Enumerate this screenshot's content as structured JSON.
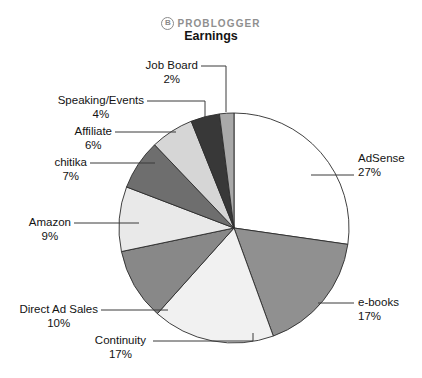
{
  "brand": {
    "mark": "B",
    "name": "PROBLOGGER"
  },
  "chart_data": {
    "type": "pie",
    "title": "Earnings",
    "xlabel": "",
    "ylabel": "",
    "legend_position": "callout-labels",
    "grid": false,
    "start_angle_deg": 0,
    "direction": "clockwise",
    "categories": [
      "AdSense",
      "e-books",
      "Continuity",
      "Direct Ad Sales",
      "Amazon",
      "chitika",
      "Affiliate",
      "Speaking/Events",
      "Job Board"
    ],
    "values": [
      27,
      17,
      17,
      10,
      9,
      7,
      6,
      4,
      2
    ],
    "value_unit": "%",
    "slices": [
      {
        "label": "AdSense",
        "value": 27,
        "pct_text": "27%",
        "color": "#ffffff"
      },
      {
        "label": "e-books",
        "value": 17,
        "pct_text": "17%",
        "color": "#909090"
      },
      {
        "label": "Continuity",
        "value": 17,
        "pct_text": "17%",
        "color": "#f1f1f1"
      },
      {
        "label": "Direct Ad Sales",
        "value": 10,
        "pct_text": "10%",
        "color": "#888888"
      },
      {
        "label": "Amazon",
        "value": 9,
        "pct_text": "9%",
        "color": "#e9e9e9"
      },
      {
        "label": "chitika",
        "value": 7,
        "pct_text": "7%",
        "color": "#6e6e6e"
      },
      {
        "label": "Affiliate",
        "value": 6,
        "pct_text": "6%",
        "color": "#d6d6d6"
      },
      {
        "label": "Speaking/Events",
        "value": 4,
        "pct_text": "4%",
        "color": "#383838"
      },
      {
        "label": "Job Board",
        "value": 2,
        "pct_text": "2%",
        "color": "#a9a9a9"
      }
    ]
  },
  "callouts": {
    "adsense": {
      "label": "AdSense",
      "pct": "27%"
    },
    "ebooks": {
      "label": "e-books",
      "pct": "17%"
    },
    "continuity": {
      "label": "Continuity",
      "pct": "17%"
    },
    "direct": {
      "label": "Direct Ad Sales",
      "pct": "10%"
    },
    "amazon": {
      "label": "Amazon",
      "pct": "9%"
    },
    "chitika": {
      "label": "chitika",
      "pct": "7%"
    },
    "affiliate": {
      "label": "Affiliate",
      "pct": "6%"
    },
    "speaking": {
      "label": "Speaking/Events",
      "pct": "4%"
    },
    "jobboard": {
      "label": "Job Board",
      "pct": "2%"
    }
  }
}
